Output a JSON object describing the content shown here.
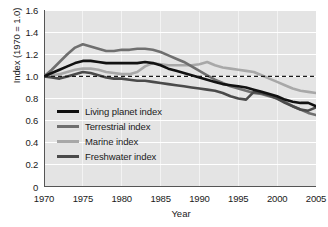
{
  "chart_data": {
    "type": "line",
    "title": "",
    "xlabel": "Year",
    "ylabel": "Index (1970 = 1.0)",
    "xlim": [
      1970,
      2005
    ],
    "ylim": [
      0,
      1.6
    ],
    "xticks": [
      "1970",
      "1975",
      "1980",
      "1985",
      "1990",
      "1995",
      "2000",
      "2005"
    ],
    "yticks": [
      "0",
      "0.2",
      "0.4",
      "0.6",
      "0.8",
      "1.0",
      "1.2",
      "1.4",
      "1.6"
    ],
    "grid": true,
    "grid_color": "#ffffff",
    "plot_background": "#e4e4e4",
    "legend_position": "lower-left-inside",
    "reference_line": {
      "value": 1.0,
      "style": "dashed",
      "color": "#1a1a1a",
      "label": "1970 baseline = 1.0"
    },
    "x": [
      1970,
      1971,
      1972,
      1973,
      1974,
      1975,
      1976,
      1977,
      1978,
      1979,
      1980,
      1981,
      1982,
      1983,
      1984,
      1985,
      1986,
      1987,
      1988,
      1989,
      1990,
      1991,
      1992,
      1993,
      1994,
      1995,
      1996,
      1997,
      1998,
      1999,
      2000,
      2001,
      2002,
      2003,
      2004,
      2005
    ],
    "series": [
      {
        "name": "Living planet index",
        "color": "#111111",
        "width": 2.6,
        "values": [
          1.0,
          1.03,
          1.06,
          1.09,
          1.12,
          1.14,
          1.14,
          1.13,
          1.12,
          1.12,
          1.12,
          1.12,
          1.12,
          1.13,
          1.12,
          1.1,
          1.07,
          1.05,
          1.03,
          1.01,
          0.99,
          0.97,
          0.95,
          0.93,
          0.92,
          0.91,
          0.9,
          0.88,
          0.86,
          0.84,
          0.82,
          0.79,
          0.77,
          0.76,
          0.76,
          0.73
        ]
      },
      {
        "name": "Terrestrial index",
        "color": "#6f6f6f",
        "width": 2.6,
        "values": [
          1.0,
          1.06,
          1.13,
          1.2,
          1.26,
          1.29,
          1.27,
          1.25,
          1.23,
          1.23,
          1.24,
          1.24,
          1.25,
          1.25,
          1.24,
          1.22,
          1.19,
          1.16,
          1.13,
          1.09,
          1.05,
          1.01,
          0.97,
          0.94,
          0.91,
          0.89,
          0.87,
          0.85,
          0.84,
          0.82,
          0.8,
          0.77,
          0.73,
          0.7,
          0.67,
          0.65
        ]
      },
      {
        "name": "Marine index",
        "color": "#a8a8a8",
        "width": 2.6,
        "values": [
          1.0,
          1.01,
          1.02,
          1.04,
          1.06,
          1.07,
          1.07,
          1.06,
          1.04,
          1.03,
          1.02,
          1.02,
          1.04,
          1.09,
          1.12,
          1.11,
          1.1,
          1.1,
          1.1,
          1.1,
          1.11,
          1.13,
          1.1,
          1.08,
          1.07,
          1.06,
          1.05,
          1.04,
          1.01,
          0.98,
          0.95,
          0.92,
          0.89,
          0.87,
          0.86,
          0.85
        ]
      },
      {
        "name": "Freshwater index",
        "color": "#4a4a4a",
        "width": 2.6,
        "values": [
          1.0,
          0.99,
          0.98,
          1.0,
          1.02,
          1.04,
          1.03,
          1.01,
          0.99,
          0.98,
          0.98,
          0.97,
          0.96,
          0.96,
          0.95,
          0.94,
          0.93,
          0.92,
          0.91,
          0.9,
          0.89,
          0.88,
          0.87,
          0.85,
          0.82,
          0.8,
          0.79,
          0.86,
          0.85,
          0.83,
          0.8,
          0.76,
          0.73,
          0.7,
          0.69,
          0.72
        ]
      }
    ]
  }
}
